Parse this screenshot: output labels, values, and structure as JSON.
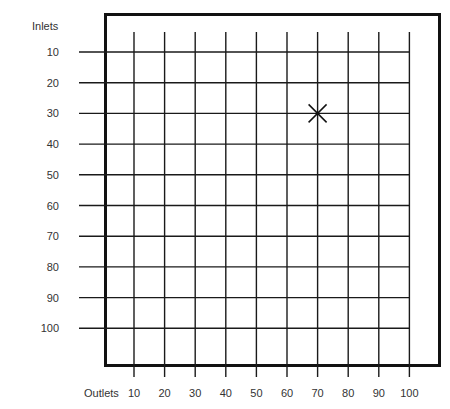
{
  "diagram": {
    "y_axis_label": "Inlets",
    "x_axis_label": "Outlets",
    "rows": [
      "10",
      "20",
      "30",
      "40",
      "50",
      "60",
      "70",
      "80",
      "90",
      "100"
    ],
    "columns": [
      "10",
      "20",
      "30",
      "40",
      "50",
      "60",
      "70",
      "80",
      "90",
      "100"
    ],
    "marker": {
      "symbol": "X",
      "column": "70",
      "row": "30"
    },
    "colors": {
      "lines": "#1a1a1a",
      "border": "#111111",
      "text": "#333333",
      "background": "#ffffff"
    }
  }
}
